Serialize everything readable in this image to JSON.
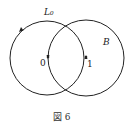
{
  "figure": {
    "caption": "図 6",
    "curve_label": "L₀",
    "region_label": "B",
    "point_labels": [
      "0",
      "1"
    ]
  },
  "circles": [
    {
      "name": "left-circle",
      "cx": 47,
      "cy": 58,
      "r": 37
    },
    {
      "name": "right-circle",
      "cx": 86,
      "cy": 58,
      "r": 38
    }
  ],
  "colors": {
    "stroke": "#222222",
    "background": "#ffffff"
  }
}
